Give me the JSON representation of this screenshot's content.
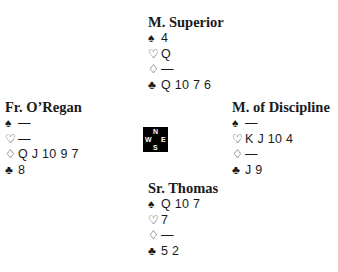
{
  "suits": {
    "spades": "♠",
    "hearts": "♡",
    "diamonds": "♢",
    "clubs": "♣"
  },
  "compass": {
    "n": "N",
    "s": "S",
    "w": "W",
    "e": "E"
  },
  "hands": {
    "north": {
      "name": "M. Superior",
      "spades": "4",
      "hearts": "Q",
      "diamonds": "—",
      "clubs": "Q 10 7 6"
    },
    "west": {
      "name": "Fr. O’Regan",
      "spades": "—",
      "hearts": "—",
      "diamonds": "Q J 10 9 7",
      "clubs": "8"
    },
    "east": {
      "name": "M. of Discipline",
      "spades": "—",
      "hearts": "K J 10 4",
      "diamonds": "—",
      "clubs": "J 9"
    },
    "south": {
      "name": "Sr. Thomas",
      "spades": "Q 10 7",
      "hearts": "7",
      "diamonds": "—",
      "clubs": "5 2"
    }
  }
}
